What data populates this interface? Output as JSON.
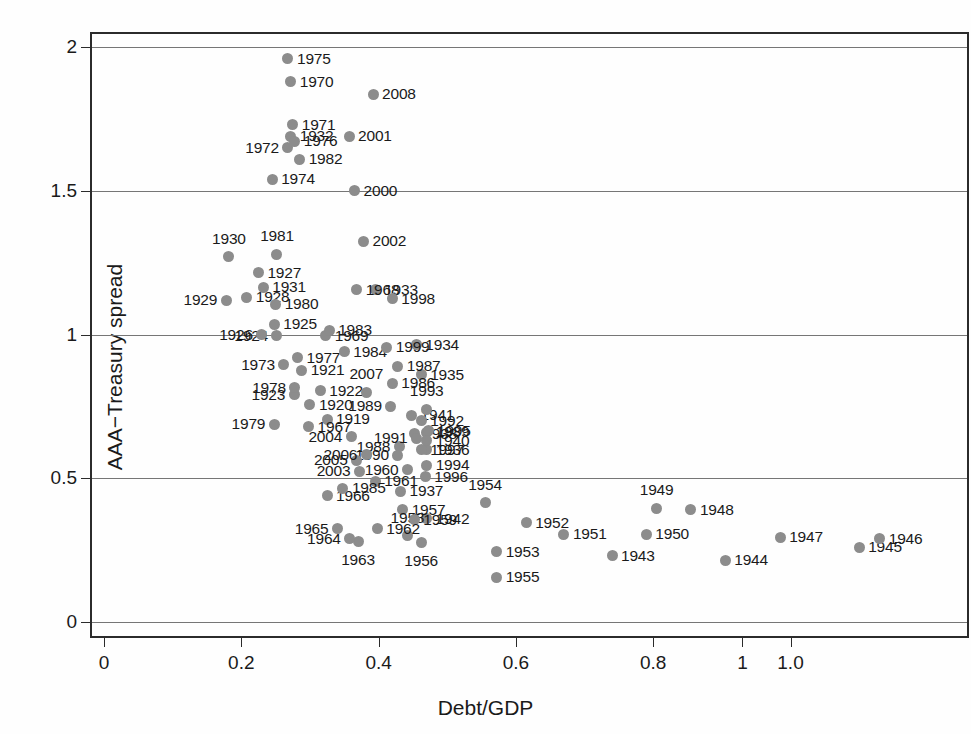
{
  "chart_data": {
    "type": "scatter",
    "title": "",
    "xlabel": "Debt/GDP",
    "ylabel": "AAA−Treasury spread",
    "xlim": [
      0,
      1.0
    ],
    "ylim": [
      0,
      2.0
    ],
    "grid": true,
    "legend": "none",
    "point_color": "#8c8c8c",
    "x_ticks": [
      {
        "value": 0,
        "label": "0"
      },
      {
        "value": 0.2,
        "label": "0.2"
      },
      {
        "value": 0.4,
        "label": "0.4"
      },
      {
        "value": 0.6,
        "label": "0.6"
      },
      {
        "value": 0.8,
        "label": "0.8"
      },
      {
        "value": 0.93,
        "label": "1"
      },
      {
        "value": 1.0,
        "label": "1.0"
      }
    ],
    "y_ticks": [
      {
        "value": 0,
        "label": "0"
      },
      {
        "value": 0.5,
        "label": "0.5"
      },
      {
        "value": 1,
        "label": "1"
      },
      {
        "value": 1.5,
        "label": "1.5"
      },
      {
        "value": 2,
        "label": "2"
      }
    ],
    "point_label_key": "year",
    "points": [
      {
        "year": "1919",
        "x": 0.325,
        "y": 0.705,
        "lab": "right"
      },
      {
        "year": "1920",
        "x": 0.3,
        "y": 0.755,
        "lab": "right"
      },
      {
        "year": "1921",
        "x": 0.288,
        "y": 0.875,
        "lab": "right"
      },
      {
        "year": "1922",
        "x": 0.315,
        "y": 0.805,
        "lab": "right"
      },
      {
        "year": "1923",
        "x": 0.277,
        "y": 0.79,
        "lab": "left"
      },
      {
        "year": "1924",
        "x": 0.252,
        "y": 0.995,
        "lab": "left"
      },
      {
        "year": "1925",
        "x": 0.248,
        "y": 1.035,
        "lab": "right"
      },
      {
        "year": "1926",
        "x": 0.23,
        "y": 1.0,
        "lab": "left"
      },
      {
        "year": "1927",
        "x": 0.225,
        "y": 1.215,
        "lab": "right"
      },
      {
        "year": "1928",
        "x": 0.208,
        "y": 1.13,
        "lab": "right"
      },
      {
        "year": "1929",
        "x": 0.178,
        "y": 1.12,
        "lab": "left"
      },
      {
        "year": "1930",
        "x": 0.182,
        "y": 1.27,
        "lab": "above"
      },
      {
        "year": "1931",
        "x": 0.232,
        "y": 1.165,
        "lab": "right"
      },
      {
        "year": "1932",
        "x": 0.272,
        "y": 1.69,
        "lab": "right"
      },
      {
        "year": "1933",
        "x": 0.395,
        "y": 1.155,
        "lab": "right"
      },
      {
        "year": "1934",
        "x": 0.455,
        "y": 0.965,
        "lab": "right"
      },
      {
        "year": "1935",
        "x": 0.462,
        "y": 0.86,
        "lab": "right"
      },
      {
        "year": "1936",
        "x": 0.47,
        "y": 0.6,
        "lab": "right"
      },
      {
        "year": "1937",
        "x": 0.432,
        "y": 0.455,
        "lab": "right"
      },
      {
        "year": "1938",
        "x": 0.452,
        "y": 0.655,
        "lab": "right"
      },
      {
        "year": "1939",
        "x": 0.47,
        "y": 0.66,
        "lab": "right"
      },
      {
        "year": "1940",
        "x": 0.47,
        "y": 0.63,
        "lab": "right"
      },
      {
        "year": "1941",
        "x": 0.448,
        "y": 0.72,
        "lab": "right"
      },
      {
        "year": "1942",
        "x": 0.47,
        "y": 0.36,
        "lab": "right"
      },
      {
        "year": "1943",
        "x": 0.74,
        "y": 0.23,
        "lab": "right"
      },
      {
        "year": "1944",
        "x": 0.905,
        "y": 0.215,
        "lab": "right"
      },
      {
        "year": "1945",
        "x": 1.1,
        "y": 0.26,
        "lab": "right"
      },
      {
        "year": "1946",
        "x": 1.13,
        "y": 0.29,
        "lab": "right"
      },
      {
        "year": "1947",
        "x": 0.985,
        "y": 0.295,
        "lab": "right"
      },
      {
        "year": "1948",
        "x": 0.855,
        "y": 0.39,
        "lab": "right"
      },
      {
        "year": "1949",
        "x": 0.805,
        "y": 0.395,
        "lab": "above"
      },
      {
        "year": "1950",
        "x": 0.79,
        "y": 0.305,
        "lab": "right"
      },
      {
        "year": "1951",
        "x": 0.67,
        "y": 0.305,
        "lab": "right"
      },
      {
        "year": "1952",
        "x": 0.615,
        "y": 0.345,
        "lab": "right"
      },
      {
        "year": "1953",
        "x": 0.572,
        "y": 0.245,
        "lab": "right"
      },
      {
        "year": "1954",
        "x": 0.555,
        "y": 0.415,
        "lab": "above"
      },
      {
        "year": "1955",
        "x": 0.572,
        "y": 0.155,
        "lab": "right"
      },
      {
        "year": "1956",
        "x": 0.462,
        "y": 0.275,
        "lab": "below"
      },
      {
        "year": "1957",
        "x": 0.435,
        "y": 0.39,
        "lab": "right"
      },
      {
        "year": "1958",
        "x": 0.442,
        "y": 0.3,
        "lab": "above"
      },
      {
        "year": "1959",
        "x": 0.452,
        "y": 0.355,
        "lab": "right"
      },
      {
        "year": "1960",
        "x": 0.442,
        "y": 0.53,
        "lab": "left"
      },
      {
        "year": "1961",
        "x": 0.395,
        "y": 0.49,
        "lab": "right"
      },
      {
        "year": "1962",
        "x": 0.398,
        "y": 0.325,
        "lab": "right"
      },
      {
        "year": "1963",
        "x": 0.37,
        "y": 0.28,
        "lab": "below"
      },
      {
        "year": "1964",
        "x": 0.358,
        "y": 0.29,
        "lab": "left"
      },
      {
        "year": "1965",
        "x": 0.34,
        "y": 0.325,
        "lab": "left"
      },
      {
        "year": "1966",
        "x": 0.325,
        "y": 0.44,
        "lab": "right"
      },
      {
        "year": "1967",
        "x": 0.298,
        "y": 0.68,
        "lab": "right"
      },
      {
        "year": "1968",
        "x": 0.368,
        "y": 1.155,
        "lab": "right"
      },
      {
        "year": "1969",
        "x": 0.323,
        "y": 0.995,
        "lab": "right"
      },
      {
        "year": "1970",
        "x": 0.272,
        "y": 1.88,
        "lab": "right"
      },
      {
        "year": "1971",
        "x": 0.275,
        "y": 1.73,
        "lab": "right"
      },
      {
        "year": "1972",
        "x": 0.268,
        "y": 1.65,
        "lab": "left"
      },
      {
        "year": "1973",
        "x": 0.262,
        "y": 0.895,
        "lab": "left"
      },
      {
        "year": "1974",
        "x": 0.245,
        "y": 1.54,
        "lab": "right"
      },
      {
        "year": "1975",
        "x": 0.268,
        "y": 1.96,
        "lab": "right"
      },
      {
        "year": "1976",
        "x": 0.278,
        "y": 1.672,
        "lab": "right"
      },
      {
        "year": "1977",
        "x": 0.282,
        "y": 0.92,
        "lab": "right"
      },
      {
        "year": "1978",
        "x": 0.278,
        "y": 0.815,
        "lab": "left"
      },
      {
        "year": "1979",
        "x": 0.248,
        "y": 0.688,
        "lab": "left"
      },
      {
        "year": "1980",
        "x": 0.25,
        "y": 1.105,
        "lab": "right"
      },
      {
        "year": "1981",
        "x": 0.252,
        "y": 1.28,
        "lab": "above"
      },
      {
        "year": "1982",
        "x": 0.285,
        "y": 1.61,
        "lab": "right"
      },
      {
        "year": "1983",
        "x": 0.328,
        "y": 1.015,
        "lab": "right"
      },
      {
        "year": "1984",
        "x": 0.35,
        "y": 0.94,
        "lab": "right"
      },
      {
        "year": "1985",
        "x": 0.348,
        "y": 0.465,
        "lab": "right"
      },
      {
        "year": "1986",
        "x": 0.42,
        "y": 0.83,
        "lab": "right"
      },
      {
        "year": "1987",
        "x": 0.428,
        "y": 0.89,
        "lab": "right"
      },
      {
        "year": "1988",
        "x": 0.43,
        "y": 0.61,
        "lab": "left"
      },
      {
        "year": "1989",
        "x": 0.418,
        "y": 0.75,
        "lab": "left"
      },
      {
        "year": "1990",
        "x": 0.428,
        "y": 0.58,
        "lab": "left"
      },
      {
        "year": "1991",
        "x": 0.455,
        "y": 0.64,
        "lab": "left"
      },
      {
        "year": "1992",
        "x": 0.462,
        "y": 0.7,
        "lab": "right"
      },
      {
        "year": "1993",
        "x": 0.47,
        "y": 0.74,
        "lab": "above"
      },
      {
        "year": "1994",
        "x": 0.47,
        "y": 0.545,
        "lab": "right"
      },
      {
        "year": "1995",
        "x": 0.472,
        "y": 0.665,
        "lab": "right"
      },
      {
        "year": "1996",
        "x": 0.468,
        "y": 0.505,
        "lab": "right"
      },
      {
        "year": "1997",
        "x": 0.462,
        "y": 0.6,
        "lab": "right"
      },
      {
        "year": "1998",
        "x": 0.42,
        "y": 1.125,
        "lab": "right"
      },
      {
        "year": "1999",
        "x": 0.412,
        "y": 0.955,
        "lab": "right"
      },
      {
        "year": "2000",
        "x": 0.365,
        "y": 1.5,
        "lab": "right"
      },
      {
        "year": "2001",
        "x": 0.357,
        "y": 1.69,
        "lab": "right"
      },
      {
        "year": "2002",
        "x": 0.378,
        "y": 1.325,
        "lab": "right"
      },
      {
        "year": "2003",
        "x": 0.372,
        "y": 0.525,
        "lab": "left"
      },
      {
        "year": "2004",
        "x": 0.36,
        "y": 0.645,
        "lab": "left"
      },
      {
        "year": "2005",
        "x": 0.368,
        "y": 0.562,
        "lab": "left"
      },
      {
        "year": "2006",
        "x": 0.382,
        "y": 0.582,
        "lab": "left"
      },
      {
        "year": "2007",
        "x": 0.382,
        "y": 0.8,
        "lab": "above"
      },
      {
        "year": "2008",
        "x": 0.392,
        "y": 1.835,
        "lab": "right"
      }
    ]
  }
}
